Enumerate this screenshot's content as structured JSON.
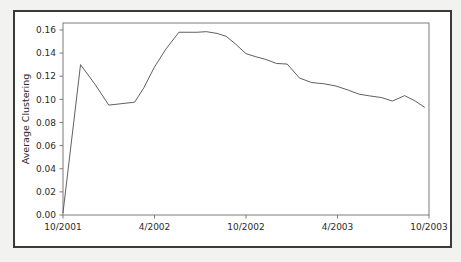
{
  "figure": {
    "background_color": "#ffffff",
    "page_color": "#f2f2f0",
    "frame_color": "#3a3a3a",
    "axis_color": "#7a7a7a",
    "line_color": "#5f5f5f",
    "text_color": "#2b2b2b"
  },
  "chart_data": {
    "type": "line",
    "title": "",
    "xlabel": "",
    "ylabel": "Average Clustering",
    "xlim": [
      0,
      24
    ],
    "ylim": [
      0.0,
      0.166
    ],
    "grid": false,
    "legend": null,
    "xtick_labels": [
      "10/2001",
      "4/2002",
      "10/2002",
      "4/2003",
      "10/2003"
    ],
    "xtick_positions": [
      0,
      6,
      12,
      18,
      24
    ],
    "ytick_labels": [
      "0.00",
      "0.02",
      "0.04",
      "0.06",
      "0.08",
      "0.10",
      "0.12",
      "0.14",
      "0.16"
    ],
    "ytick_values": [
      0.0,
      0.02,
      0.04,
      0.06,
      0.08,
      0.1,
      0.12,
      0.14,
      0.16
    ],
    "series": [
      {
        "name": "Average Clustering",
        "x": [
          0.0,
          1.15,
          2.1,
          3.0,
          4.0,
          4.7,
          5.3,
          6.0,
          6.75,
          7.6,
          8.2,
          8.8,
          9.4,
          10.1,
          10.7,
          11.3,
          12.0,
          12.6,
          13.3,
          14.0,
          14.7,
          15.5,
          16.3,
          17.1,
          17.9,
          18.7,
          19.4,
          20.1,
          20.9,
          21.6,
          22.4,
          23.1,
          23.7
        ],
        "y": [
          0.002,
          0.13,
          0.113,
          0.095,
          0.0965,
          0.0975,
          0.11,
          0.128,
          0.1435,
          0.158,
          0.158,
          0.158,
          0.1585,
          0.157,
          0.1545,
          0.148,
          0.1395,
          0.137,
          0.1345,
          0.131,
          0.1305,
          0.1185,
          0.1145,
          0.1135,
          0.1115,
          0.108,
          0.1045,
          0.103,
          0.1015,
          0.0985,
          0.1032,
          0.0985,
          0.0932
        ]
      }
    ]
  }
}
